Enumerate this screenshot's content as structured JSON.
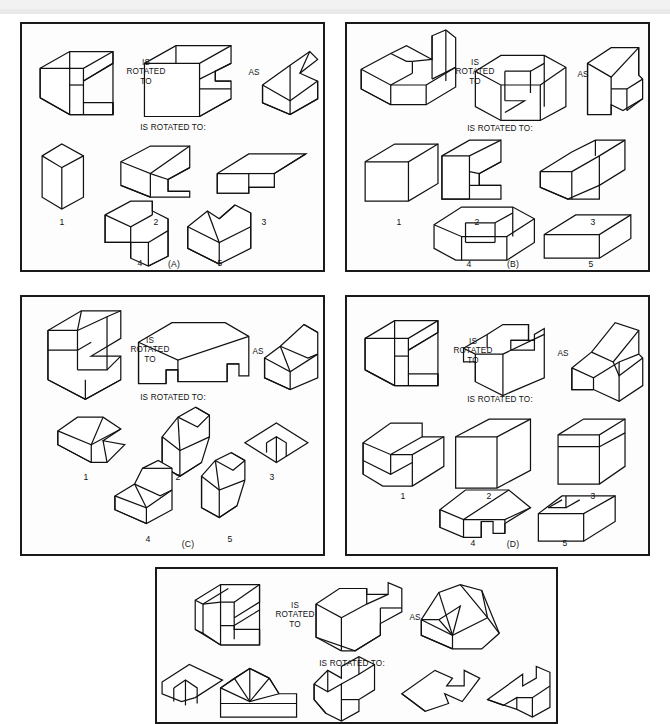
{
  "figure": {
    "type": "spatial-rotation-test",
    "background_color": "#ffffff",
    "panel_border_color": "#1a1a1a",
    "line_color": "#111111",
    "panel_count": 5
  },
  "strings": {
    "is_rotated_to_stacked": "IS\nROTATED\nTO",
    "as": "AS",
    "is_rotated_to_colon": "IS ROTATED TO:"
  },
  "panels": [
    {
      "id": "A",
      "caption": "(A)",
      "prompt_line": "IS\nROTATED\nTO",
      "as_label": "AS",
      "question_line": "IS ROTATED TO:",
      "options": [
        "1",
        "2",
        "3",
        "4",
        "5"
      ],
      "top_row_objects": [
        "stem-object",
        "rotated-object",
        "as-object"
      ],
      "option_count": 5
    },
    {
      "id": "B",
      "caption": "(B)",
      "prompt_line": "IS\nROTATED\nTO",
      "as_label": "AS",
      "question_line": "IS ROTATED TO:",
      "options": [
        "1",
        "2",
        "3",
        "4",
        "5"
      ],
      "top_row_objects": [
        "stem-object",
        "rotated-object",
        "as-object"
      ],
      "option_count": 5
    },
    {
      "id": "C",
      "caption": "(C)",
      "prompt_line": "IS\nROTATED\nTO",
      "as_label": "AS",
      "question_line": "IS ROTATED TO:",
      "options": [
        "1",
        "2",
        "3",
        "4",
        "5"
      ],
      "top_row_objects": [
        "stem-object",
        "rotated-object",
        "as-object"
      ],
      "option_count": 5
    },
    {
      "id": "D",
      "caption": "(D)",
      "prompt_line": "IS\nROTATED\nTO",
      "as_label": "AS",
      "question_line": "IS ROTATED TO:",
      "options": [
        "1",
        "2",
        "3",
        "4",
        "5"
      ],
      "top_row_objects": [
        "stem-object",
        "rotated-object",
        "as-object"
      ],
      "option_count": 5
    },
    {
      "id": "E",
      "caption": "",
      "prompt_line": "IS\nROTATED\nTO",
      "as_label": "AS",
      "question_line": "IS ROTATED TO:",
      "options": [],
      "top_row_objects": [
        "stem-object",
        "rotated-object",
        "as-object"
      ],
      "option_count": 5
    }
  ]
}
